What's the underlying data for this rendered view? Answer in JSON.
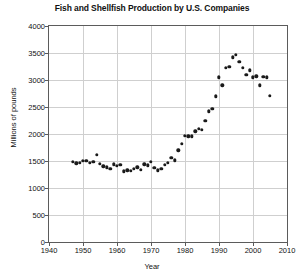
{
  "chart_data": {
    "type": "scatter",
    "title": "Fish and Shellfish Production by U.S. Companies",
    "xlabel": "Year",
    "ylabel": "Millions of pounds",
    "xlim": [
      1940,
      2010
    ],
    "ylim": [
      0,
      4000
    ],
    "xticks": [
      1940,
      1950,
      1960,
      1970,
      1980,
      1990,
      2000,
      2010
    ],
    "yticks": [
      0,
      500,
      1000,
      1500,
      2000,
      2500,
      3000,
      3500,
      4000
    ],
    "grid": true,
    "legend": false,
    "marker_color": "#1a1a1a",
    "series": [
      {
        "name": "Fish and shellfish production",
        "x": [
          1947,
          1948,
          1949,
          1950,
          1951,
          1952,
          1953,
          1954,
          1955,
          1956,
          1957,
          1958,
          1959,
          1960,
          1961,
          1962,
          1963,
          1964,
          1965,
          1966,
          1967,
          1968,
          1969,
          1970,
          1971,
          1972,
          1973,
          1974,
          1975,
          1976,
          1977,
          1978,
          1979,
          1980,
          1981,
          1982,
          1983,
          1984,
          1985,
          1986,
          1987,
          1988,
          1989,
          1990,
          1991,
          1992,
          1993,
          1994,
          1995,
          1996,
          1997,
          1998,
          1999,
          2000,
          2001,
          2002,
          2003,
          2004,
          2005
        ],
        "y": [
          1480,
          1460,
          1470,
          1500,
          1500,
          1470,
          1490,
          1620,
          1450,
          1400,
          1380,
          1360,
          1440,
          1410,
          1430,
          1310,
          1330,
          1320,
          1360,
          1380,
          1340,
          1440,
          1420,
          1480,
          1370,
          1330,
          1350,
          1430,
          1470,
          1560,
          1510,
          1700,
          1820,
          1970,
          1960,
          1960,
          2050,
          2100,
          2080,
          2250,
          2420,
          2470,
          2700,
          3050,
          2900,
          3230,
          3250,
          3420,
          3470,
          3340,
          3230,
          3100,
          3180,
          3050,
          3070,
          2900,
          3060,
          3050,
          2710
        ]
      }
    ],
    "annotations": []
  }
}
